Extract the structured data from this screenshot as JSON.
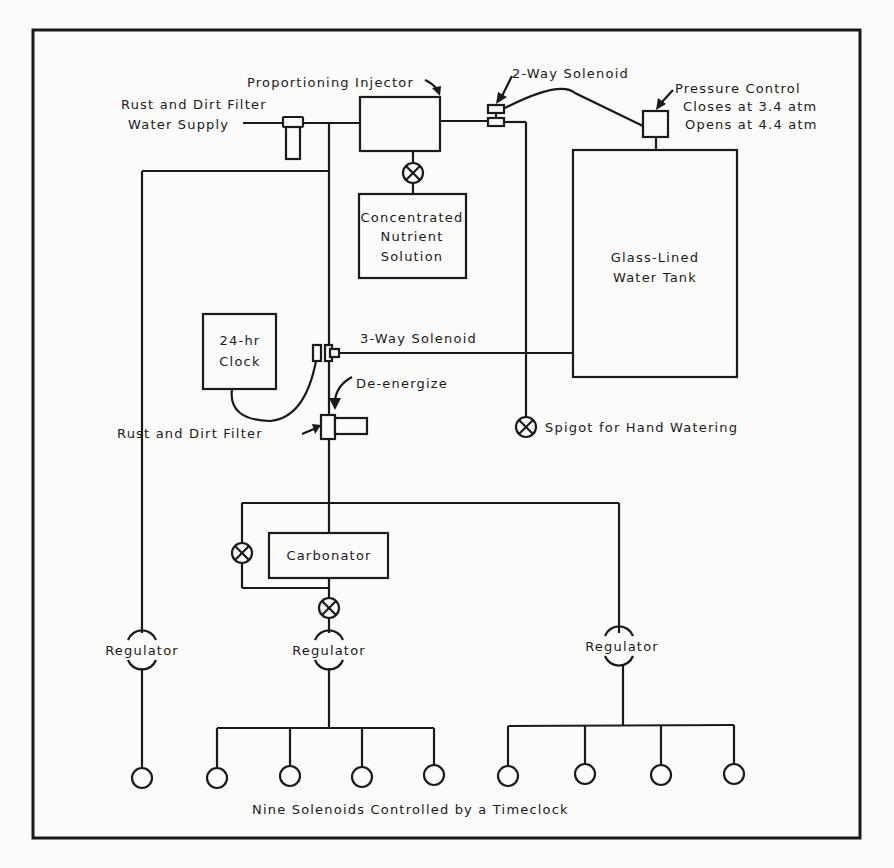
{
  "diagram": {
    "labels": {
      "proportioning_injector": "Proportioning Injector",
      "rust_dirt_filter_top": "Rust and Dirt Filter",
      "water_supply": "Water Supply",
      "two_way_solenoid": "2-Way Solenoid",
      "pressure_control": "Pressure Control",
      "pressure_closes": "Closes at 3.4 atm",
      "pressure_opens": "Opens at 4.4 atm",
      "concentrated_line1": "Concentrated",
      "concentrated_line2": "Nutrient",
      "concentrated_line3": "Solution",
      "tank_line1": "Glass-Lined",
      "tank_line2": "Water Tank",
      "clock_line1": "24-hr",
      "clock_line2": "Clock",
      "three_way_solenoid": "3-Way Solenoid",
      "de_energize": "De-energize",
      "rust_dirt_filter_mid": "Rust and Dirt Filter",
      "spigot": "Spigot for Hand Watering",
      "carbonator": "Carbonator",
      "regulator_left": "Regulator",
      "regulator_middle": "Regulator",
      "regulator_right": "Regulator",
      "footer": "Nine Solenoids Controlled by a Timeclock"
    },
    "solenoid_count": 9
  }
}
